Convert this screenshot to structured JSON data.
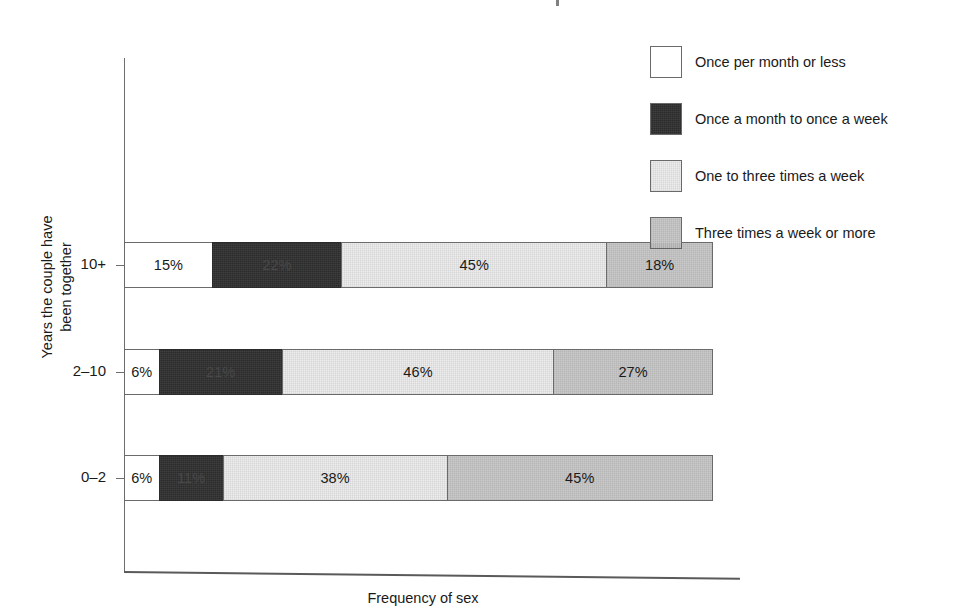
{
  "figure": {
    "xlabel": "Frequency of sex",
    "ylabel_line1": "Years the couple have",
    "ylabel_line2": "been together"
  },
  "legend": {
    "items": [
      {
        "label": "Once per month or less",
        "swatch": "white-swatch",
        "color": "#ffffff"
      },
      {
        "label": "Once a month to once a week",
        "swatch": "black-swatch",
        "color": "#2b2b2b"
      },
      {
        "label": "One to three times a week",
        "swatch": "light-gray-swatch",
        "color": "#ededed"
      },
      {
        "label": "Three times a week or more",
        "swatch": "medium-gray-swatch",
        "color": "#c9c9c9"
      }
    ]
  },
  "bars": [
    {
      "category": "10+",
      "segments": [
        {
          "label": "15%",
          "value": 15
        },
        {
          "label": "22%",
          "value": 22
        },
        {
          "label": "45%",
          "value": 45
        },
        {
          "label": "18%",
          "value": 18
        }
      ]
    },
    {
      "category": "2–10",
      "segments": [
        {
          "label": "6%",
          "value": 6
        },
        {
          "label": "21%",
          "value": 21
        },
        {
          "label": "46%",
          "value": 46
        },
        {
          "label": "27%",
          "value": 27
        }
      ]
    },
    {
      "category": "0–2",
      "segments": [
        {
          "label": "6%",
          "value": 6
        },
        {
          "label": "11%",
          "value": 11
        },
        {
          "label": "38%",
          "value": 38
        },
        {
          "label": "45%",
          "value": 45
        }
      ]
    }
  ],
  "chart_data": {
    "type": "bar",
    "orientation": "horizontal",
    "stacked": true,
    "normalized": "100%",
    "title": "",
    "xlabel": "Frequency of sex",
    "ylabel": "Years the couple have been together",
    "categories": [
      "10+",
      "2–10",
      "0–2"
    ],
    "series": [
      {
        "name": "Once per month or less",
        "color": "#ffffff",
        "values": [
          15,
          6,
          6
        ]
      },
      {
        "name": "Once a month to once a week",
        "color": "#2b2b2b",
        "values": [
          22,
          21,
          11
        ]
      },
      {
        "name": "One to three times a week",
        "color": "#ededed",
        "values": [
          45,
          46,
          38
        ]
      },
      {
        "name": "Three times a week or more",
        "color": "#c9c9c9",
        "values": [
          18,
          27,
          45
        ]
      }
    ],
    "xlim": [
      0,
      100
    ],
    "grid": false,
    "legend_position": "top-right",
    "data_labels": true,
    "units": "percent"
  }
}
